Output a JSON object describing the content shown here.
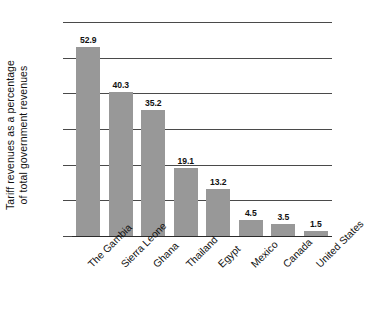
{
  "chart_data": {
    "type": "bar",
    "title": "",
    "subtitle": "",
    "xlabel": "",
    "ylabel_line1": "Tariff revenues as a percentage",
    "ylabel_line2": "of total government revenues",
    "ylabel": "Tariff revenues as a percentage of total government revenues",
    "categories": [
      "The Gambia",
      "Sierra Leone",
      "Ghana",
      "Thailand",
      "Egypt",
      "Mexico",
      "Canada",
      "United States"
    ],
    "values": [
      52.9,
      40.3,
      35.2,
      19.1,
      13.2,
      4.5,
      3.5,
      1.5
    ],
    "value_labels": [
      "52.9",
      "40.3",
      "35.2",
      "19.1",
      "13.2",
      "4.5",
      "3.5",
      "1.5"
    ],
    "ylim": [
      0,
      60
    ],
    "yticks": [
      0,
      10,
      20,
      30,
      40,
      50,
      60
    ],
    "ytick_labels": [
      "0",
      "10",
      "20",
      "30",
      "40",
      "50",
      "60"
    ],
    "grid": true,
    "grid_axis": "y",
    "legend": false,
    "legend_position": "none",
    "bar_color": "#989898",
    "axis_color": "#4a4a4a",
    "text_color": "#111111",
    "background_color": "#ffffff"
  }
}
